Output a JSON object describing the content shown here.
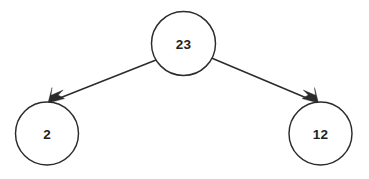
{
  "diagram": {
    "background_color": "#ffffff",
    "stroke_color": "#2b2b2b",
    "text_color": "#222222",
    "nodes": [
      {
        "id": "root",
        "label": "23",
        "cx": 183.5,
        "cy": 43.5,
        "r": 32.0
      },
      {
        "id": "left",
        "label": "2",
        "cx": 47.0,
        "cy": 133.5,
        "r": 31.5
      },
      {
        "id": "right",
        "label": "12",
        "cx": 320.5,
        "cy": 133.5,
        "r": 31.5
      }
    ],
    "edges": [
      {
        "id": "root-to-left",
        "from": "root",
        "to": "left",
        "x1": 156.0,
        "y1": 60.0,
        "x2": 48.5,
        "y2": 102.5,
        "arrowhead": "filled-barbed"
      },
      {
        "id": "root-to-right",
        "from": "root",
        "to": "right",
        "x1": 211.5,
        "y1": 58.0,
        "x2": 318.0,
        "y2": 102.5,
        "arrowhead": "filled-barbed"
      }
    ]
  }
}
